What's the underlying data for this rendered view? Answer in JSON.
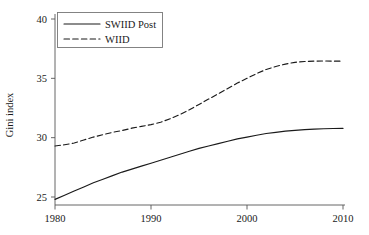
{
  "chart_data": {
    "type": "line",
    "title": "",
    "subtitle": "",
    "xlabel": "",
    "ylabel": "Gini index",
    "xlim": [
      1980,
      2010
    ],
    "ylim": [
      24.3,
      40.4
    ],
    "xticks": [
      "1980",
      "1990",
      "2000",
      "2010"
    ],
    "xtick_values": [
      1980,
      1990,
      2000,
      2010
    ],
    "yticks": [
      "25",
      "30",
      "35",
      "40"
    ],
    "ytick_values": [
      25,
      30,
      35,
      40
    ],
    "grid": false,
    "legend_position": "top-left",
    "series": [
      {
        "name": "SWIID Post",
        "style": "solid",
        "color": "#1a1a1a",
        "x": [
          1980,
          1981,
          1982,
          1983,
          1984,
          1985,
          1986,
          1987,
          1988,
          1989,
          1990,
          1991,
          1992,
          1993,
          1994,
          1995,
          1996,
          1997,
          1998,
          1999,
          2000,
          2001,
          2002,
          2003,
          2004,
          2005,
          2006,
          2007,
          2008,
          2009,
          2010
        ],
        "values": [
          24.8,
          25.15,
          25.5,
          25.85,
          26.2,
          26.5,
          26.8,
          27.1,
          27.35,
          27.6,
          27.85,
          28.1,
          28.35,
          28.6,
          28.85,
          29.1,
          29.3,
          29.5,
          29.7,
          29.9,
          30.05,
          30.2,
          30.35,
          30.45,
          30.55,
          30.62,
          30.68,
          30.72,
          30.75,
          30.77,
          30.78
        ]
      },
      {
        "name": "WIID",
        "style": "dashed",
        "color": "#1a1a1a",
        "x": [
          1980,
          1981,
          1982,
          1983,
          1984,
          1985,
          1986,
          1987,
          1988,
          1989,
          1990,
          1991,
          1992,
          1993,
          1994,
          1995,
          1996,
          1997,
          1998,
          1999,
          2000,
          2001,
          2002,
          2003,
          2004,
          2005,
          2006,
          2007,
          2008,
          2009,
          2010
        ],
        "values": [
          29.3,
          29.4,
          29.55,
          29.8,
          30.05,
          30.25,
          30.45,
          30.6,
          30.8,
          30.95,
          31.1,
          31.3,
          31.6,
          31.95,
          32.35,
          32.8,
          33.25,
          33.7,
          34.15,
          34.6,
          35.0,
          35.4,
          35.75,
          36.0,
          36.2,
          36.35,
          36.42,
          36.45,
          36.46,
          36.45,
          36.45
        ]
      }
    ],
    "legend_entries": [
      {
        "label": "SWIID Post",
        "style": "solid"
      },
      {
        "label": "WIID",
        "style": "dashed"
      }
    ]
  }
}
